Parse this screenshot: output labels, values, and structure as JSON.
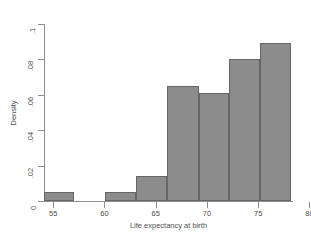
{
  "chart_data": {
    "type": "bar",
    "title": "",
    "xlabel": "Life expectancy at birth",
    "ylabel": "Density",
    "xlim": [
      54.1,
      78.3
    ],
    "ylim": [
      0,
      0.1
    ],
    "grid": false,
    "legend": null,
    "xticks": [
      "55",
      "60",
      "65",
      "70",
      "75",
      "80"
    ],
    "xtick_values": [
      55,
      60,
      65,
      70,
      75,
      80
    ],
    "yticks": [
      "0",
      ".02",
      ".04",
      ".06",
      ".08",
      ".1"
    ],
    "ytick_values": [
      0,
      0.02,
      0.04,
      0.06,
      0.08,
      0.1
    ],
    "bar_color": "#8c8c8c",
    "bar_edge_color": "#666666",
    "axis_color": "#8e8e8e",
    "bins": [
      {
        "x0": 54.1,
        "x1": 57.0,
        "value": 0.005
      },
      {
        "x0": 60.1,
        "x1": 63.1,
        "value": 0.005
      },
      {
        "x0": 63.1,
        "x1": 66.1,
        "value": 0.014
      },
      {
        "x0": 66.1,
        "x1": 69.2,
        "value": 0.065
      },
      {
        "x0": 69.2,
        "x1": 72.2,
        "value": 0.061
      },
      {
        "x0": 72.2,
        "x1": 75.2,
        "value": 0.08
      },
      {
        "x0": 75.2,
        "x1": 78.2,
        "value": 0.089
      }
    ]
  }
}
